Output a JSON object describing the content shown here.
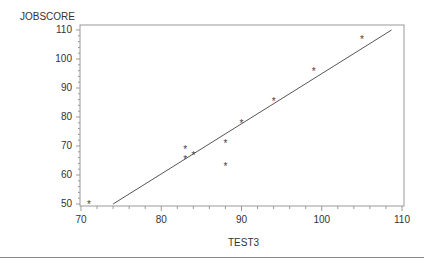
{
  "chart_data": {
    "type": "scatter",
    "title": "",
    "xlabel": "TEST3",
    "ylabel": "JOBSCORE",
    "xlim": [
      70,
      110
    ],
    "ylim": [
      50,
      110
    ],
    "x_ticks": [
      70,
      80,
      90,
      100,
      110
    ],
    "y_ticks": [
      50,
      60,
      70,
      80,
      90,
      100,
      110
    ],
    "x_tick_labels": [
      "70",
      "80",
      "90",
      "100",
      "110"
    ],
    "y_tick_labels": [
      "50",
      "60",
      "70",
      "80",
      "90",
      "100",
      "110"
    ],
    "grid": false,
    "legend": null,
    "marker": "*",
    "series": [
      {
        "name": "observed",
        "type": "scatter",
        "points": [
          {
            "x": 71,
            "y": 50
          },
          {
            "x": 83,
            "y": 69
          },
          {
            "x": 83,
            "y": 65.5
          },
          {
            "x": 84,
            "y": 67
          },
          {
            "x": 88,
            "y": 71
          },
          {
            "x": 88,
            "y": 63
          },
          {
            "x": 90,
            "y": 78
          },
          {
            "x": 94,
            "y": 85.5
          },
          {
            "x": 99,
            "y": 96
          },
          {
            "x": 105,
            "y": 107
          }
        ]
      },
      {
        "name": "regression line",
        "type": "line",
        "points": [
          {
            "x": 74,
            "y": 50
          },
          {
            "x": 108.7,
            "y": 110
          }
        ]
      }
    ]
  },
  "labels": {
    "xlabel": "TEST3",
    "ylabel": "JOBSCORE"
  },
  "colors": {
    "axis": "#999999",
    "line": "#555555",
    "marker": "#444444",
    "text": "#333333"
  }
}
